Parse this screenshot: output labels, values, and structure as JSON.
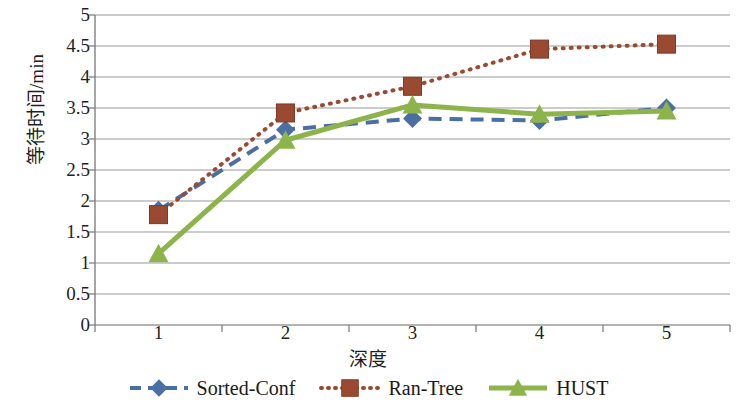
{
  "chart_data": {
    "type": "line",
    "title": "",
    "xlabel": "深度",
    "ylabel": "等待时间/min",
    "categories": [
      "1",
      "2",
      "3",
      "4",
      "5"
    ],
    "x": [
      1,
      2,
      3,
      4,
      5
    ],
    "ylim": [
      0,
      5
    ],
    "yticks": [
      "0",
      "0.5",
      "1",
      "1.5",
      "2",
      "2.5",
      "3",
      "3.5",
      "4",
      "4.5",
      "5"
    ],
    "ytick_values": [
      0,
      0.5,
      1,
      1.5,
      2,
      2.5,
      3,
      3.5,
      4,
      4.5,
      5
    ],
    "grid": "horizontal",
    "legend_position": "bottom",
    "series": [
      {
        "name": "Sorted-Conf",
        "values": [
          1.85,
          3.15,
          3.33,
          3.3,
          3.5
        ],
        "color": "#4a6fa5",
        "line_style": "dashed",
        "marker": "diamond"
      },
      {
        "name": "Ran-Tree",
        "values": [
          1.78,
          3.42,
          3.85,
          4.45,
          4.53
        ],
        "color": "#9b4a32",
        "line_style": "dotted",
        "marker": "square"
      },
      {
        "name": "HUST",
        "values": [
          1.15,
          2.98,
          3.55,
          3.4,
          3.45
        ],
        "color": "#8cb44a",
        "line_style": "solid",
        "marker": "triangle"
      }
    ]
  },
  "legend": {
    "items": [
      {
        "label": "Sorted-Conf"
      },
      {
        "label": "Ran-Tree"
      },
      {
        "label": "HUST"
      }
    ]
  },
  "axes": {
    "y_title": "等待时间/min",
    "x_title": "深度"
  }
}
